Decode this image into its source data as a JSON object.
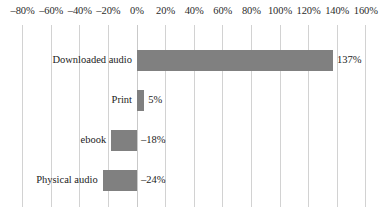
{
  "chart_data": {
    "type": "bar",
    "orientation": "horizontal",
    "title": "",
    "xlabel": "",
    "ylabel": "",
    "categories": [
      "Downloaded audio",
      "Print",
      "ebook",
      "Physical audio"
    ],
    "values": [
      137,
      5,
      -18,
      -24
    ],
    "value_labels": [
      "137%",
      "5%",
      "–18%",
      "–24%"
    ],
    "xlim": [
      -80,
      160
    ],
    "xtick_labels": [
      "–80%",
      "–60%",
      "–40%",
      "–20%",
      "0%",
      "20%",
      "40%",
      "60%",
      "80%",
      "100%",
      "120%",
      "140%",
      "160%"
    ],
    "xtick_values": [
      -80,
      -60,
      -40,
      -20,
      0,
      20,
      40,
      60,
      80,
      100,
      120,
      140,
      160
    ],
    "grid": true,
    "legend": false,
    "bar_color": "#808080",
    "gridline_color": "#d2d2d2",
    "text_color": "#1c1c1c",
    "background": "#ffffff"
  }
}
